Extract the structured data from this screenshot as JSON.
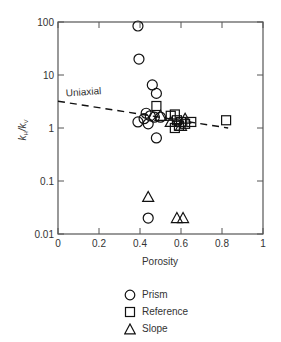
{
  "chart_data": {
    "type": "scatter",
    "title": "",
    "xlabel": "Porosity",
    "ylabel": "k_H/k_V",
    "xlim": [
      0,
      1
    ],
    "ylim": [
      0.01,
      100
    ],
    "yscale": "log",
    "grid": false,
    "x_ticks": [
      "0",
      "0.2",
      "0.4",
      "0.6",
      "0.8",
      "1"
    ],
    "y_ticks": [
      "0.01",
      "0.1",
      "1",
      "10",
      "100"
    ],
    "legend_position": "below",
    "series": [
      {
        "name": "Prism",
        "marker": "circle",
        "points": [
          {
            "x": 0.39,
            "y": 84
          },
          {
            "x": 0.395,
            "y": 20
          },
          {
            "x": 0.46,
            "y": 6.5
          },
          {
            "x": 0.48,
            "y": 4.5
          },
          {
            "x": 0.43,
            "y": 1.9
          },
          {
            "x": 0.45,
            "y": 1.7
          },
          {
            "x": 0.47,
            "y": 1.6
          },
          {
            "x": 0.39,
            "y": 1.3
          },
          {
            "x": 0.44,
            "y": 1.2
          },
          {
            "x": 0.42,
            "y": 1.5
          },
          {
            "x": 0.5,
            "y": 1.6
          },
          {
            "x": 0.48,
            "y": 0.65
          },
          {
            "x": 0.44,
            "y": 0.02
          }
        ]
      },
      {
        "name": "Reference",
        "marker": "square",
        "points": [
          {
            "x": 0.48,
            "y": 2.6
          },
          {
            "x": 0.55,
            "y": 1.7
          },
          {
            "x": 0.57,
            "y": 1.8
          },
          {
            "x": 0.58,
            "y": 1.4
          },
          {
            "x": 0.6,
            "y": 1.3
          },
          {
            "x": 0.59,
            "y": 1.1
          },
          {
            "x": 0.62,
            "y": 1.2
          },
          {
            "x": 0.65,
            "y": 1.3
          },
          {
            "x": 0.57,
            "y": 1.0
          },
          {
            "x": 0.82,
            "y": 1.4
          }
        ]
      },
      {
        "name": "Slope",
        "marker": "triangle",
        "points": [
          {
            "x": 0.5,
            "y": 1.7
          },
          {
            "x": 0.55,
            "y": 1.3
          },
          {
            "x": 0.62,
            "y": 1.5
          },
          {
            "x": 0.6,
            "y": 1.1
          },
          {
            "x": 0.44,
            "y": 0.05
          },
          {
            "x": 0.58,
            "y": 0.02
          },
          {
            "x": 0.61,
            "y": 0.02
          }
        ]
      }
    ],
    "lines": [
      {
        "name": "Uniaxial",
        "style": "dashed",
        "points": [
          {
            "x": 0.0,
            "y": 3.2
          },
          {
            "x": 0.83,
            "y": 1.0
          }
        ]
      }
    ],
    "annotations": [
      {
        "text": "Uniaxial",
        "x": 0.04,
        "y": 3.6
      }
    ]
  },
  "legend": {
    "items": [
      {
        "label": "Prism",
        "marker": "circle"
      },
      {
        "label": "Reference",
        "marker": "square"
      },
      {
        "label": "Slope",
        "marker": "triangle"
      }
    ]
  },
  "ylabel_main": "k",
  "ylabel_h": "H",
  "ylabel_sep": "/k",
  "ylabel_v": "V"
}
